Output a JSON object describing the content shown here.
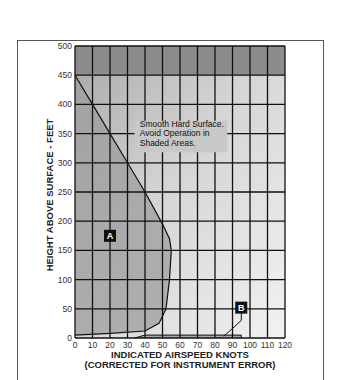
{
  "chart_data": {
    "type": "area",
    "xlabel": "INDICATED AIRSPEED KNOTS",
    "xlabel_sub": "(CORRECTED FOR INSTRUMENT ERROR)",
    "ylabel": "HEIGHT ABOVE SURFACE - FEET",
    "xlim": [
      0,
      120
    ],
    "ylim": [
      0,
      500
    ],
    "x_ticks": [
      0,
      10,
      20,
      30,
      40,
      50,
      60,
      70,
      80,
      90,
      100,
      110,
      120
    ],
    "y_ticks": [
      0,
      50,
      100,
      150,
      200,
      250,
      300,
      350,
      400,
      450,
      500
    ],
    "grid": true,
    "annotation": "Smooth Hard Surface. Avoid Operation in Shaded Areas.",
    "regions": [
      {
        "name": "A",
        "label_position": [
          20,
          175
        ],
        "boundary": [
          [
            0,
            450
          ],
          [
            10,
            400
          ],
          [
            20,
            350
          ],
          [
            30,
            300
          ],
          [
            40,
            250
          ],
          [
            50,
            195
          ],
          [
            54,
            170
          ],
          [
            55,
            150
          ],
          [
            54,
            100
          ],
          [
            52,
            50
          ],
          [
            48,
            25
          ],
          [
            40,
            12
          ],
          [
            20,
            8
          ],
          [
            0,
            5
          ]
        ]
      },
      {
        "name": "B",
        "label_position": [
          95,
          52
        ],
        "boundary": [
          [
            34,
            0
          ],
          [
            40,
            5
          ],
          [
            95,
            5
          ],
          [
            95,
            0
          ]
        ]
      },
      {
        "name": "upper-shaded",
        "boundary": [
          [
            0,
            450
          ],
          [
            120,
            450
          ],
          [
            120,
            500
          ],
          [
            0,
            500
          ]
        ]
      }
    ]
  },
  "labels": {
    "ylabel": "HEIGHT ABOVE SURFACE - FEET",
    "xlabel1": "INDICATED AIRSPEED KNOTS",
    "xlabel2": "(CORRECTED FOR INSTRUMENT ERROR)",
    "note1": "Smooth Hard Surface.",
    "note2": "Avoid Operation in",
    "note3": "Shaded Areas.",
    "regionA": "A",
    "regionB": "B"
  }
}
